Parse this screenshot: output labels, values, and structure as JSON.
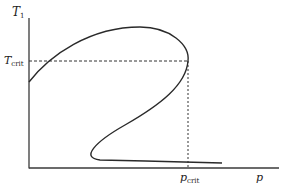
{
  "diagram": {
    "y_axis": {
      "label": "T",
      "label_sub": "1"
    },
    "x_axis": {
      "label": "p"
    },
    "critical": {
      "t_label": "T",
      "t_label_sub": "crit",
      "p_label": "p",
      "p_label_sub": "crit"
    },
    "colors": {
      "curve": "#2a2a2a",
      "axis": "#3a3a3a",
      "dashed": "#333333",
      "background": "#ffffff"
    }
  }
}
